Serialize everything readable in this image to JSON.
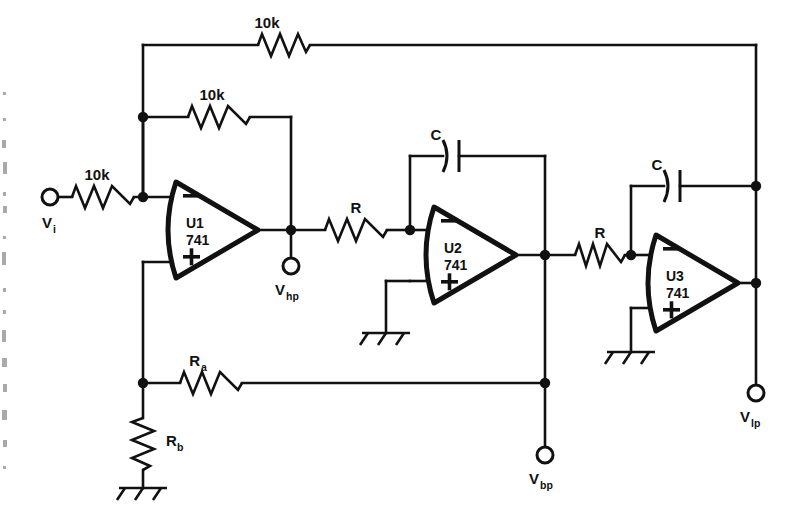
{
  "figure": {
    "ink_color": "#111111",
    "background": "#ffffff"
  },
  "opamps": [
    {
      "id": "U1",
      "designator": "U1",
      "part": "741",
      "minus": "−",
      "plus": "+"
    },
    {
      "id": "U2",
      "designator": "U2",
      "part": "741",
      "minus": "−",
      "plus": "+"
    },
    {
      "id": "U3",
      "designator": "U3",
      "part": "741",
      "minus": "−",
      "plus": "+"
    }
  ],
  "resistors": [
    {
      "id": "r-top-feedback",
      "label": "10k"
    },
    {
      "id": "r-u1-feedback",
      "label": "10k"
    },
    {
      "id": "r-input",
      "label": "10k"
    },
    {
      "id": "r-int1",
      "label": "R"
    },
    {
      "id": "r-int2",
      "label": "R"
    },
    {
      "id": "r-ra",
      "label": "R",
      "sub": "a"
    },
    {
      "id": "r-rb",
      "label": "R",
      "sub": "b"
    }
  ],
  "capacitors": [
    {
      "id": "c-u2",
      "label": "C"
    },
    {
      "id": "c-u3",
      "label": "C"
    }
  ],
  "terminals": [
    {
      "id": "t-vi",
      "label": "V",
      "sub": "i"
    },
    {
      "id": "t-vhp",
      "label": "V",
      "sub": "hp"
    },
    {
      "id": "t-vbp",
      "label": "V",
      "sub": "bp"
    },
    {
      "id": "t-vlp",
      "label": "V",
      "sub": "lp"
    }
  ],
  "grounds": [
    {
      "id": "gnd-u2"
    },
    {
      "id": "gnd-u3"
    },
    {
      "id": "gnd-rb"
    }
  ]
}
